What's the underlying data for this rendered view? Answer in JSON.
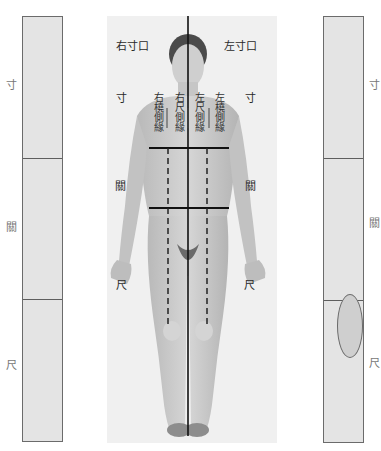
{
  "left_panel": {
    "sections": [
      "寸",
      "關",
      "尺"
    ],
    "labels": {
      "cun": "寸",
      "guan": "關",
      "chi": "尺"
    }
  },
  "right_panel": {
    "sections": [
      "寸",
      "關",
      "尺"
    ],
    "labels": {
      "cun": "寸",
      "guan": "關",
      "chi": "尺"
    },
    "highlight": {
      "section": "尺",
      "shape": "oval"
    }
  },
  "figure": {
    "labels": {
      "right_cunkou": "右寸口",
      "left_cunkou": "左寸口",
      "cun_left": "寸",
      "cun_right": "寸",
      "guan_left": "關",
      "guan_right": "關",
      "chi_left": "尺",
      "chi_right": "尺"
    },
    "vertical_labels": {
      "right_radial": "右橈側緣",
      "right_ulnar": "右尺側緣",
      "left_ulnar": "左尺側緣",
      "left_radial": "左橈側緣"
    }
  },
  "colors": {
    "panel_fill": "#e4e4e4",
    "panel_border": "#6b6b6b",
    "oval_fill": "#cfcfcf",
    "line": "#1a1a1a"
  }
}
